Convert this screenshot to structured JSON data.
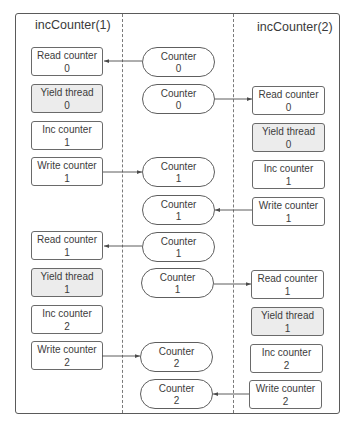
{
  "diagram": {
    "left_lane": {
      "title": "incCounter(1)",
      "steps": [
        {
          "label": "Read counter",
          "value": "0"
        },
        {
          "label": "Yield thread",
          "value": "0"
        },
        {
          "label": "Inc counter",
          "value": "1"
        },
        {
          "label": "Write counter",
          "value": "1"
        },
        {
          "label": "Read counter",
          "value": "1"
        },
        {
          "label": "Yield thread",
          "value": "1"
        },
        {
          "label": "Inc counter",
          "value": "2"
        },
        {
          "label": "Write counter",
          "value": "2"
        }
      ]
    },
    "shared": {
      "counters": [
        {
          "label": "Counter",
          "value": "0"
        },
        {
          "label": "Counter",
          "value": "0"
        },
        {
          "label": "Counter",
          "value": "1"
        },
        {
          "label": "Counter",
          "value": "1"
        },
        {
          "label": "Counter",
          "value": "1"
        },
        {
          "label": "Counter",
          "value": "1"
        },
        {
          "label": "Counter",
          "value": "2"
        },
        {
          "label": "Counter",
          "value": "2"
        }
      ]
    },
    "right_lane": {
      "title": "incCounter(2)",
      "steps": [
        {
          "label": "Read counter",
          "value": "0"
        },
        {
          "label": "Yield thread",
          "value": "0"
        },
        {
          "label": "Inc counter",
          "value": "1"
        },
        {
          "label": "Write counter",
          "value": "1"
        },
        {
          "label": "Read counter",
          "value": "1"
        },
        {
          "label": "Yield thread",
          "value": "1"
        },
        {
          "label": "Inc counter",
          "value": "2"
        },
        {
          "label": "Write counter",
          "value": "2"
        }
      ]
    },
    "arrows": [
      {
        "from": "shared.counters.0",
        "to": "left_lane.steps.0"
      },
      {
        "from": "shared.counters.1",
        "to": "right_lane.steps.0"
      },
      {
        "from": "left_lane.steps.3",
        "to": "shared.counters.2"
      },
      {
        "from": "right_lane.steps.3",
        "to": "shared.counters.3"
      },
      {
        "from": "shared.counters.4",
        "to": "left_lane.steps.4"
      },
      {
        "from": "shared.counters.5",
        "to": "right_lane.steps.4"
      },
      {
        "from": "left_lane.steps.7",
        "to": "shared.counters.6"
      },
      {
        "from": "right_lane.steps.7",
        "to": "shared.counters.7"
      }
    ]
  },
  "colors": {
    "border": "#5a5a5a",
    "yield_fill": "#ececec",
    "box_fill": "#ffffff",
    "text": "#3a3a3a",
    "arrow": "#4a4a4a"
  }
}
